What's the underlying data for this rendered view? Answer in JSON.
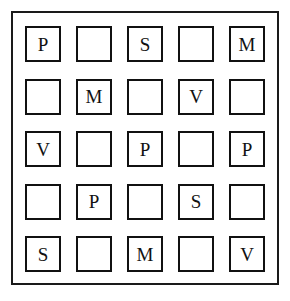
{
  "panel": {
    "border_color": "#1a1a1a",
    "background_color": "#ffffff"
  },
  "grid": {
    "rows": 5,
    "columns": 5,
    "cell_border_color": "#111111",
    "letter_color": "#111111",
    "empty_marker": "",
    "cells": [
      [
        {
          "label": "P",
          "empty": false
        },
        {
          "label": "",
          "empty": true
        },
        {
          "label": "S",
          "empty": false
        },
        {
          "label": "",
          "empty": true
        },
        {
          "label": "M",
          "empty": false
        }
      ],
      [
        {
          "label": "",
          "empty": true
        },
        {
          "label": "M",
          "empty": false
        },
        {
          "label": "",
          "empty": true
        },
        {
          "label": "V",
          "empty": false
        },
        {
          "label": "",
          "empty": true
        }
      ],
      [
        {
          "label": "V",
          "empty": false
        },
        {
          "label": "",
          "empty": true
        },
        {
          "label": "P",
          "empty": false
        },
        {
          "label": "",
          "empty": true
        },
        {
          "label": "P",
          "empty": false
        }
      ],
      [
        {
          "label": "",
          "empty": true
        },
        {
          "label": "P",
          "empty": false
        },
        {
          "label": "",
          "empty": true
        },
        {
          "label": "S",
          "empty": false
        },
        {
          "label": "",
          "empty": true
        }
      ],
      [
        {
          "label": "S",
          "empty": false
        },
        {
          "label": "",
          "empty": true
        },
        {
          "label": "M",
          "empty": false
        },
        {
          "label": "",
          "empty": true
        },
        {
          "label": "V",
          "empty": false
        }
      ]
    ]
  }
}
